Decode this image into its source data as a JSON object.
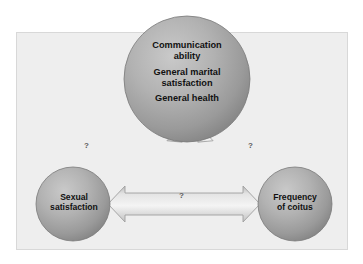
{
  "diagram": {
    "panel": {
      "background_color": "#eeeeee",
      "border_color": "#d8d8d8"
    },
    "nodes": [
      {
        "id": "top",
        "name": "determinants-node",
        "shape": "sphere",
        "lines": [
          [
            "Communication",
            "ability"
          ],
          [
            "General marital",
            "satisfaction"
          ],
          [
            "General health"
          ]
        ],
        "fill_light": "#bdbdbd",
        "fill_dark": "#8a8a8a",
        "text_color": "#111111"
      },
      {
        "id": "left",
        "name": "sexual-satisfaction-node",
        "shape": "sphere",
        "lines": [
          [
            "Sexual",
            "satisfaction"
          ]
        ],
        "fill_light": "#bdbdbd",
        "fill_dark": "#8a8a8a",
        "text_color": "#111111"
      },
      {
        "id": "right",
        "name": "frequency-of-coitus-node",
        "shape": "sphere",
        "lines": [
          [
            "Frequency",
            "of coitus"
          ]
        ],
        "fill_light": "#bdbdbd",
        "fill_dark": "#8a8a8a",
        "text_color": "#111111"
      }
    ],
    "connectors": [
      {
        "id": "top-to-left",
        "name": "arrow-top-to-sexual-satisfaction",
        "style": "double-headed",
        "label": "?",
        "label_color": "#5a5a5a"
      },
      {
        "id": "top-to-right",
        "name": "arrow-top-to-frequency-of-coitus",
        "style": "double-headed",
        "label": "?",
        "label_color": "#5a5a5a"
      },
      {
        "id": "left-to-right",
        "name": "arrow-sexual-satisfaction-to-frequency",
        "style": "double-headed",
        "label": "?",
        "label_color": "#5a5a5a"
      }
    ],
    "labels": {
      "top_line1": "Communication",
      "top_line2": "ability",
      "top_line3": "General marital",
      "top_line4": "satisfaction",
      "top_line5": "General health",
      "left_line1": "Sexual",
      "left_line2": "satisfaction",
      "right_line1": "Frequency",
      "right_line2": "of coitus",
      "question_left": "?",
      "question_right": "?",
      "question_middle": "?"
    }
  }
}
